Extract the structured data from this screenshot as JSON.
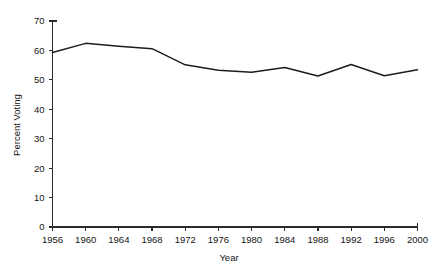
{
  "chart_data": {
    "type": "line",
    "title": "",
    "xlabel": "Year",
    "ylabel": "Percent Voting",
    "x": [
      1956,
      1960,
      1964,
      1968,
      1972,
      1976,
      1980,
      1984,
      1988,
      1992,
      1996,
      2000
    ],
    "categories": [
      "1956",
      "1960",
      "1964",
      "1968",
      "1972",
      "1976",
      "1980",
      "1984",
      "1988",
      "1992",
      "1996",
      "2000"
    ],
    "values": [
      59.3,
      62.4,
      61.4,
      60.6,
      55.1,
      53.3,
      52.6,
      54.2,
      51.3,
      55.2,
      51.4,
      53.4
    ],
    "series": [
      {
        "name": "Percent Voting",
        "values": [
          59.3,
          62.4,
          61.4,
          60.6,
          55.1,
          53.3,
          52.6,
          54.2,
          51.3,
          55.2,
          51.4,
          53.4
        ]
      }
    ],
    "xlim": [
      1956,
      2000
    ],
    "ylim": [
      0,
      70
    ],
    "yticks": [
      0,
      10,
      20,
      30,
      40,
      50,
      60,
      70
    ],
    "ytick_labels": [
      "0",
      "10",
      "20",
      "30",
      "40",
      "50",
      "60",
      "70"
    ],
    "xticks": [
      1956,
      1960,
      1964,
      1968,
      1972,
      1976,
      1980,
      1984,
      1988,
      1992,
      1996,
      2000
    ],
    "xtick_labels": [
      "1956",
      "1960",
      "1964",
      "1968",
      "1972",
      "1976",
      "1980",
      "1984",
      "1988",
      "1992",
      "1996",
      "2000"
    ],
    "grid": false,
    "legend": false,
    "line_color": "#1d1d1d",
    "axis_color": "#2b2b2b",
    "background": "#ffffff"
  }
}
